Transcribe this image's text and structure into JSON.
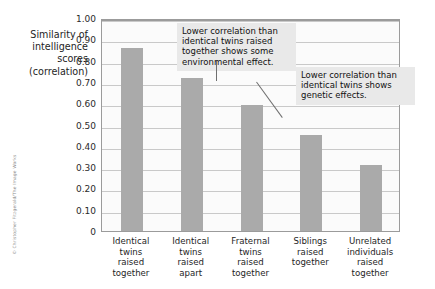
{
  "credit": "© Christopher Fitzgerald/The Image Works",
  "axis": {
    "y_title_lines": [
      "Similarity of",
      "intelligence",
      "scores",
      "(correlation)"
    ],
    "y_ticks": [
      "1.00",
      "0.90",
      "0.80",
      "0.70",
      "0.60",
      "0.50",
      "0.40",
      "0.30",
      "0.20",
      "0.10",
      "0"
    ]
  },
  "annotations": [
    {
      "name": "environmental-effect-callout",
      "lines": [
        "Lower correlation than",
        "identical twins raised",
        "together shows some",
        "environmental effect."
      ]
    },
    {
      "name": "genetic-effect-callout",
      "lines": [
        "Lower correlation than",
        "identical twins shows",
        "genetic effects."
      ]
    }
  ],
  "category_label_lines": [
    [
      "Identical",
      "twins",
      "raised",
      "together"
    ],
    [
      "Identical",
      "twins",
      "raised",
      "apart"
    ],
    [
      "Fraternal",
      "twins",
      "raised",
      "together"
    ],
    [
      "Siblings",
      "raised",
      "together"
    ],
    [
      "Unrelated",
      "individuals",
      "raised",
      "together"
    ]
  ],
  "colors": {
    "bar": "#aaaaaa",
    "grid": "#c9c9c9",
    "frame": "#9b9b9b",
    "callout_bg": "#e9e9e9"
  },
  "chart_data": {
    "type": "bar",
    "title": "",
    "xlabel": "",
    "ylabel": "Similarity of intelligence scores (correlation)",
    "ylim": [
      0,
      1.0
    ],
    "ytick_step": 0.1,
    "grid": true,
    "legend": "none",
    "categories": [
      "Identical twins raised together",
      "Identical twins raised apart",
      "Fraternal twins raised together",
      "Siblings raised together",
      "Unrelated individuals raised together"
    ],
    "values": [
      0.86,
      0.72,
      0.59,
      0.45,
      0.31
    ]
  }
}
